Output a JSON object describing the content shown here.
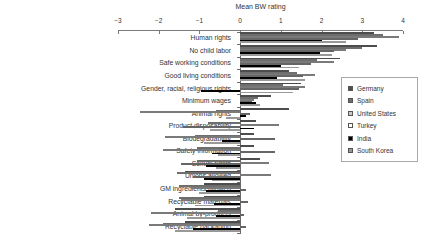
{
  "chart_data": {
    "type": "bar",
    "orientation": "horizontal",
    "axis_title": "Mean BW rating",
    "xlabel": "Mean BW rating",
    "ylabel": "",
    "xlim": [
      -3,
      4
    ],
    "x_ticks": [
      "-3",
      "-2",
      "-1",
      "0",
      "1",
      "2",
      "3",
      "4"
    ],
    "grid": false,
    "legend_position": "right",
    "categories": [
      "Human rights",
      "No child labor",
      "Safe working conditions",
      "Good living conditions",
      "Gender, racial, religious rights",
      "Minimum wages",
      "Animal rights",
      "Product disposability",
      "Biodegradability",
      "Safety information",
      "Sexual rights",
      "Unions allowed",
      "GM ingredients allowed",
      "Recyclable materials",
      "Animal by-products",
      "Recyclable packaging"
    ],
    "series": [
      {
        "name": "Germany",
        "color": "#4d4d4d",
        "border": "#333333",
        "values": [
          3.3,
          3.35,
          2.45,
          1.2,
          1.5,
          0.75,
          1.2,
          0.4,
          0.35,
          0.35,
          0.5,
          -1.35,
          -0.9,
          -0.9,
          -1.6,
          -1.35
        ]
      },
      {
        "name": "Spain",
        "color": "#6e6e6e",
        "border": "#444444",
        "values": [
          3.5,
          3.0,
          1.9,
          1.4,
          1.05,
          0.45,
          -0.6,
          -0.8,
          -1.1,
          -1.05,
          -1.05,
          -1.55,
          -1.5,
          -1.5,
          -0.55,
          -1.9
        ]
      },
      {
        "name": "United States",
        "color": "#c9c9c9",
        "border": "#7a7a7a",
        "values": [
          3.9,
          2.6,
          2.3,
          1.85,
          1.6,
          0.35,
          -2.45,
          0.95,
          -1.85,
          -1.9,
          0.7,
          0.75,
          -1.2,
          -1.45,
          -2.2,
          -2.25
        ]
      },
      {
        "name": "Turkey",
        "color": "#ffffff",
        "border": "#666666",
        "values": [
          2.9,
          2.3,
          1.75,
          1.55,
          1.45,
          0.3,
          0.25,
          -1.4,
          0.85,
          0.85,
          -1.45,
          -1.15,
          0.15,
          0.2,
          0.1,
          0.15
        ]
      },
      {
        "name": "India",
        "color": "#000000",
        "border": "#000000",
        "values": [
          2.0,
          1.95,
          1.0,
          0.9,
          -0.95,
          0.4,
          0.15,
          0.35,
          -0.45,
          -0.7,
          -0.85,
          -0.9,
          -0.85,
          -0.65,
          -0.6,
          -1.15
        ]
      },
      {
        "name": "South Korea",
        "color": "#999999",
        "border": "#5f5f5f",
        "values": [
          2.6,
          2.25,
          1.45,
          1.6,
          1.3,
          0.5,
          -0.35,
          -0.75,
          -0.9,
          -0.55,
          -0.6,
          -0.7,
          -1.0,
          -1.1,
          -1.3,
          -1.6
        ]
      }
    ]
  }
}
